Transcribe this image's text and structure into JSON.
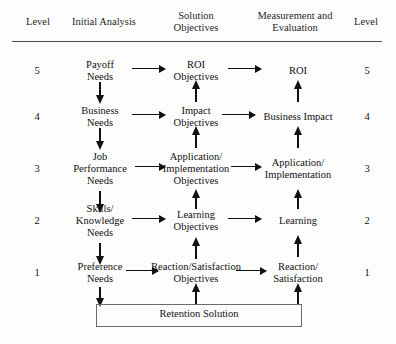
{
  "header": {
    "level_left": "Level",
    "columns": [
      "Initial Analysis",
      "Solution\nObjectives",
      "Measurement and\nEvaluation"
    ],
    "col_initial_analysis": "Initial Analysis",
    "col_solution_objectives_line1": "Solution",
    "col_solution_objectives_line2": "Objectives",
    "col_measurement_line1": "Measurement and",
    "col_measurement_line2": "Evaluation",
    "level_right": "Level"
  },
  "rows": [
    {
      "level": "5",
      "initial_analysis": "Payoff\nNeeds",
      "initial_analysis_l1": "Payoff",
      "initial_analysis_l2": "Needs",
      "solution_objectives": "ROI\nObjectives",
      "solution_l1": "ROI",
      "solution_l2": "Objectives",
      "measurement": "ROI",
      "measurement_l1": "ROI",
      "measurement_l2": ""
    },
    {
      "level": "4",
      "initial_analysis": "Business\nNeeds",
      "initial_analysis_l1": "Business",
      "initial_analysis_l2": "Needs",
      "solution_objectives": "Impact\nObjectives",
      "solution_l1": "Impact",
      "solution_l2": "Objectives",
      "measurement": "Business Impact",
      "measurement_l1": "Business Impact",
      "measurement_l2": ""
    },
    {
      "level": "3",
      "initial_analysis": "Job\nPerformance\nNeeds",
      "initial_analysis_l1": "Job",
      "initial_analysis_l2": "Performance",
      "initial_analysis_l3": "Needs",
      "solution_objectives": "Application/\nImplementation\nObjectives",
      "solution_l1": "Application/",
      "solution_l2": "Implementation",
      "solution_l3": "Objectives",
      "measurement": "Application/\nImplementation",
      "measurement_l1": "Application/",
      "measurement_l2": "Implementation"
    },
    {
      "level": "2",
      "initial_analysis": "Skills/\nKnowledge\nNeeds",
      "initial_analysis_l1": "Skills/",
      "initial_analysis_l2": "Knowledge",
      "initial_analysis_l3": "Needs",
      "solution_objectives": "Learning\nObjectives",
      "solution_l1": "Learning",
      "solution_l2": "Objectives",
      "measurement": "Learning",
      "measurement_l1": "Learning",
      "measurement_l2": ""
    },
    {
      "level": "1",
      "initial_analysis": "Preference\nNeeds",
      "initial_analysis_l1": "Preference",
      "initial_analysis_l2": "Needs",
      "solution_objectives": "Reaction/Satisfaction\nObjectives",
      "solution_l1": "Reaction/Satisfaction",
      "solution_l2": "Objectives",
      "measurement": "Reaction/\nSatisfaction",
      "measurement_l1": "Reaction/",
      "measurement_l2": "Satisfaction"
    }
  ],
  "footer": {
    "retention_solution": "Retention Solution"
  },
  "colors": {
    "text": "#111111",
    "rule": "#4a4a4a",
    "arrow": "#111111",
    "box_border": "#6b6b6b",
    "background": "#fdfdfd"
  }
}
